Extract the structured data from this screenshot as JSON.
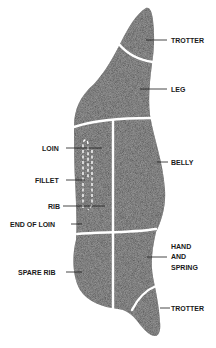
{
  "diagram": {
    "colors": {
      "meat": "#5e5e5e",
      "seam": "#ffffff",
      "label": "#1a1a1a",
      "background": "#ffffff"
    },
    "labels": {
      "trotter_top": "TROTTER",
      "leg": "LEG",
      "loin": "LOIN",
      "belly": "BELLY",
      "fillet": "FILLET",
      "rib": "RIB",
      "end_of_loin": "END OF LOIN",
      "hand_line1": "HAND",
      "hand_line2": "AND",
      "hand_line3": "SPRING",
      "spare_rib": "SPARE RIB",
      "trotter_bottom": "TROTTER"
    }
  }
}
